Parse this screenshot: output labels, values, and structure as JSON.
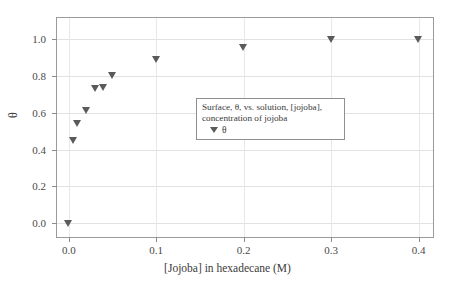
{
  "chart_data": {
    "type": "scatter",
    "title": "",
    "xlabel": "[Jojoba] in hexadecane (M)",
    "ylabel": "θ",
    "xlim": [
      -0.0135,
      0.4165
    ],
    "ylim": [
      -0.075,
      1.115
    ],
    "xticks": [
      0.0,
      0.1,
      0.2,
      0.3,
      0.4
    ],
    "xticklabels": [
      "0.0",
      "0.1",
      "0.2",
      "0.3",
      "0.4"
    ],
    "yticks": [
      0.0,
      0.2,
      0.4,
      0.6,
      0.8,
      1.0
    ],
    "yticklabels": [
      "0.0",
      "0.2",
      "0.4",
      "0.6",
      "0.8",
      "1.0"
    ],
    "grid": true,
    "legend_position": "center",
    "marker": "triangle-down",
    "marker_color": "#5a5a5a",
    "series": [
      {
        "name": "θ",
        "x": [
          0.0,
          0.005,
          0.01,
          0.02,
          0.03,
          0.04,
          0.05,
          0.1,
          0.2,
          0.3,
          0.4
        ],
        "y": [
          0.0,
          0.45,
          0.54,
          0.61,
          0.73,
          0.735,
          0.805,
          0.89,
          0.955,
          1.0,
          1.0
        ]
      }
    ]
  },
  "legend": {
    "title_line1": "Surface, θ, vs. solution, [jojoba],",
    "title_line2": "concentration of jojoba",
    "entry_label": "θ"
  },
  "axes": {
    "x_title": "[Jojoba] in hexadecane (M)",
    "y_title": "θ"
  }
}
